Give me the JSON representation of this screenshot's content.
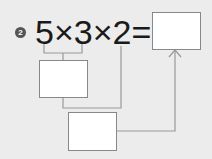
{
  "problem": {
    "number_badge": "2",
    "expression": "5×3×2=",
    "operands": [
      "5",
      "3",
      "2"
    ],
    "operator": "×",
    "equals": "=",
    "answer_box": "",
    "intermediate_box": "",
    "second_box": ""
  },
  "colors": {
    "background": "#ececec",
    "line": "#999999",
    "box_border": "#888888",
    "text": "#1a1a1a"
  }
}
